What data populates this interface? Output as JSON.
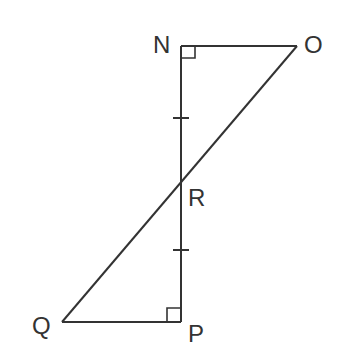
{
  "diagram": {
    "type": "geometry",
    "points": {
      "N": {
        "label": "N",
        "x": 181,
        "y": 46
      },
      "O": {
        "label": "O",
        "x": 297,
        "y": 46
      },
      "R": {
        "label": "R",
        "x": 181,
        "y": 181
      },
      "P": {
        "label": "P",
        "x": 181,
        "y": 322
      },
      "Q": {
        "label": "Q",
        "x": 62,
        "y": 322
      }
    },
    "segments": [
      [
        "N",
        "O"
      ],
      [
        "O",
        "Q"
      ],
      [
        "N",
        "P"
      ],
      [
        "Q",
        "P"
      ]
    ],
    "right_angles": [
      "N",
      "P"
    ],
    "congruence_marks": [
      "NR",
      "RP"
    ],
    "line_color": "#333333"
  }
}
